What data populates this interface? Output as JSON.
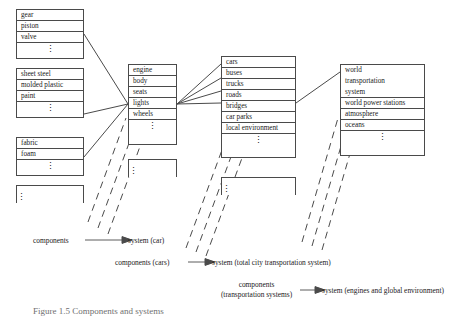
{
  "figure": {
    "caption": "Figure 1.5   Components and systems"
  },
  "columns": [
    {
      "name": "components-column",
      "groups": [
        {
          "name": "engine-parts",
          "items": [
            "gear",
            "piston",
            "valve"
          ],
          "continuation": "⋮"
        },
        {
          "name": "body-materials",
          "items": [
            "sheet steel",
            "molded plastic",
            "paint"
          ],
          "continuation": "⋮"
        },
        {
          "name": "seat-materials",
          "items": [
            "fabric",
            "foam"
          ],
          "continuation": "⋮"
        },
        {
          "name": "more-components",
          "items": [],
          "continuation": "⋮"
        }
      ]
    },
    {
      "name": "car-system-column",
      "groups": [
        {
          "name": "car-subsystems",
          "items": [
            "engine",
            "body",
            "seats",
            "lights",
            "wheels"
          ],
          "continuation": "⋮"
        },
        {
          "name": "more-car-systems",
          "items": [],
          "continuation": "⋮"
        }
      ]
    },
    {
      "name": "city-transportation-column",
      "groups": [
        {
          "name": "city-transport-elements",
          "items": [
            "cars",
            "buses",
            "trucks",
            "roads",
            "bridges",
            "car parks",
            "local environment"
          ],
          "continuation": "⋮"
        },
        {
          "name": "more-transport-systems",
          "items": [],
          "continuation": "⋮"
        }
      ]
    },
    {
      "name": "global-environment-column",
      "groups": [
        {
          "name": "global-elements",
          "items": [
            "world transportation system",
            "world power stations",
            "atmosphere",
            "oceans"
          ],
          "multiline_first": [
            "world",
            "transportation",
            "system"
          ],
          "continuation": "⋮"
        }
      ]
    }
  ],
  "legend": [
    {
      "name": "legend-row-1",
      "left": "components",
      "right": "system (car)"
    },
    {
      "name": "legend-row-2",
      "left": "components (cars)",
      "right": "system (total city transportation system)"
    },
    {
      "name": "legend-row-3",
      "left_line1": "components",
      "left_line2": "(transportation systems)",
      "right": "system (engines and global environment)"
    }
  ],
  "colors": {
    "stroke": "#4a4a4a",
    "text": "#1a1a1a",
    "caption": "#6f6f6f",
    "background": "#ffffff"
  }
}
